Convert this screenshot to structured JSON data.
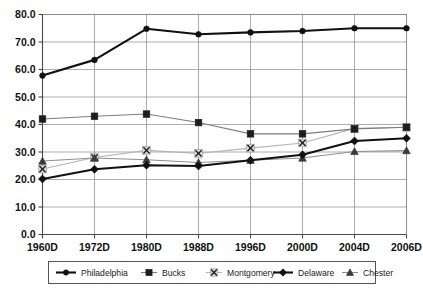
{
  "chart_data": {
    "type": "line",
    "title": "",
    "xlabel": "",
    "ylabel": "",
    "categories": [
      "1960D",
      "1972D",
      "1980D",
      "1988D",
      "1996D",
      "2000D",
      "2004D",
      "2006D"
    ],
    "ylim": [
      0.0,
      80.0
    ],
    "ytick_labels": [
      "0.0",
      "10.0",
      "20.0",
      "30.0",
      "40.0",
      "50.0",
      "60.0",
      "70.0",
      "80.0"
    ],
    "ytick_values": [
      0.0,
      10.0,
      20.0,
      30.0,
      40.0,
      50.0,
      60.0,
      70.0,
      80.0
    ],
    "grid": true,
    "legend_position": "bottom",
    "series": [
      {
        "name": "Philadelphia",
        "marker": "filled-circle",
        "color": "#111111",
        "line_width": 2.1,
        "values": [
          57.8,
          63.5,
          74.8,
          72.8,
          73.5,
          74.0,
          75.0,
          75.0
        ]
      },
      {
        "name": "Bucks",
        "marker": "filled-square",
        "color": "#7d7d7d",
        "line_width": 1.1,
        "values": [
          42.0,
          43.0,
          43.8,
          40.7,
          36.6,
          36.6,
          38.4,
          39.0
        ]
      },
      {
        "name": "Montgomery",
        "marker": "cross-x",
        "color": "#b5b5b5",
        "line_width": 1.1,
        "values": [
          23.8,
          28.0,
          30.6,
          29.5,
          31.4,
          33.3,
          38.6,
          39.0
        ]
      },
      {
        "name": "Delaware",
        "marker": "filled-diamond",
        "color": "#111111",
        "line_width": 2.1,
        "values": [
          20.2,
          23.7,
          25.2,
          24.9,
          27.0,
          29.0,
          34.0,
          35.0
        ]
      },
      {
        "name": "Chester",
        "marker": "filled-triangle",
        "color": "#8f8f8f",
        "line_width": 1.1,
        "values": [
          26.7,
          27.8,
          27.2,
          26.2,
          27.0,
          27.8,
          30.2,
          30.5
        ]
      }
    ]
  },
  "legend": {
    "items": [
      {
        "label": "Philadelphia"
      },
      {
        "label": "Bucks"
      },
      {
        "label": "Montgomery"
      },
      {
        "label": "Delaware"
      },
      {
        "label": "Chester"
      }
    ]
  }
}
